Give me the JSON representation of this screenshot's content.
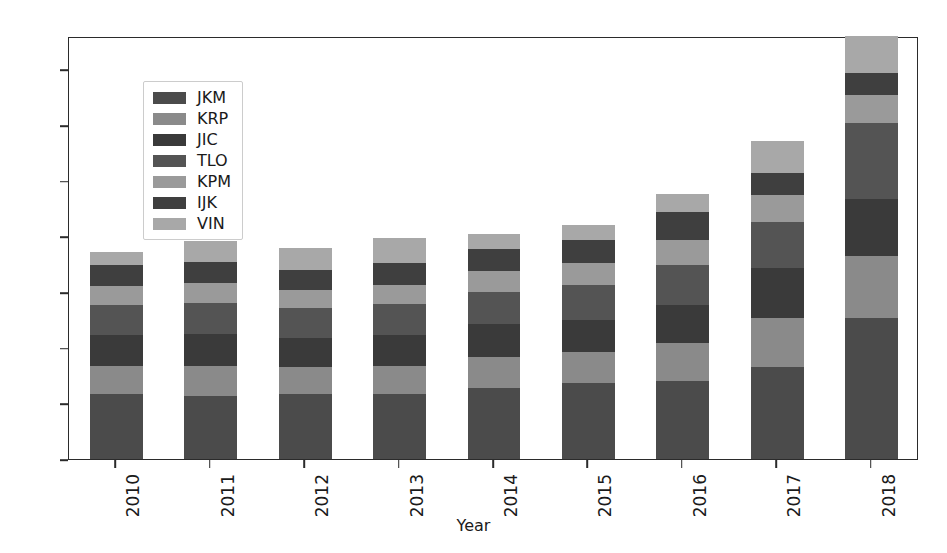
{
  "chart_data": {
    "type": "bar",
    "stacked": true,
    "title": "",
    "xlabel": "Year",
    "ylabel": "",
    "categories": [
      "2010",
      "2011",
      "2012",
      "2013",
      "2014",
      "2015",
      "2016",
      "2017",
      "2018"
    ],
    "ylim": [
      0,
      380
    ],
    "yticks": [
      0,
      50,
      100,
      150,
      200,
      250,
      300,
      350
    ],
    "ytick_labels": [
      "0",
      "50",
      "100",
      "150",
      "200",
      "250",
      "300",
      "350"
    ],
    "grid": false,
    "legend_position": "upper left",
    "legend_entries": [
      "JKM",
      "KRP",
      "JIC",
      "TLO",
      "KPM",
      "IJK",
      "VIN"
    ],
    "series": [
      {
        "name": "JKM",
        "color": "#4b4b4b",
        "values": [
          58,
          57,
          58,
          58,
          64,
          68,
          70,
          83,
          127
        ]
      },
      {
        "name": "KRP",
        "color": "#8a8a8a",
        "values": [
          26,
          27,
          25,
          26,
          28,
          28,
          34,
          44,
          55
        ]
      },
      {
        "name": "JIC",
        "color": "#3a3a3a",
        "values": [
          27,
          28,
          26,
          27,
          29,
          29,
          34,
          45,
          52
        ]
      },
      {
        "name": "TLO",
        "color": "#545454",
        "values": [
          27,
          28,
          27,
          28,
          29,
          31,
          36,
          41,
          68
        ]
      },
      {
        "name": "KPM",
        "color": "#9a9a9a",
        "values": [
          17,
          18,
          16,
          17,
          19,
          20,
          23,
          24,
          25
        ]
      },
      {
        "name": "IJK",
        "color": "#3f3f3f",
        "values": [
          19,
          19,
          18,
          20,
          20,
          21,
          25,
          20,
          20
        ]
      },
      {
        "name": "VIN",
        "color": "#a8a8a8",
        "values": [
          12,
          19,
          20,
          23,
          13,
          13,
          16,
          29,
          33
        ]
      }
    ],
    "totals": [
      186,
      196,
      190,
      199,
      202,
      210,
      238,
      286,
      380
    ]
  },
  "axis": {
    "xlabel": "Year",
    "ytick_labels": [
      "0",
      "50",
      "100",
      "150",
      "200",
      "250",
      "300",
      "350"
    ],
    "xtick_labels": [
      "2010",
      "2011",
      "2012",
      "2013",
      "2014",
      "2015",
      "2016",
      "2017",
      "2018"
    ]
  }
}
